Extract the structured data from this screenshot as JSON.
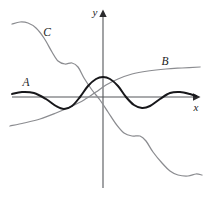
{
  "figure": {
    "background_color": "#ffffff",
    "axis_color": "#55565a",
    "curve_a_color": "#17171a",
    "curve_b_color": "#8b8c90",
    "curve_c_color": "#8b8c90"
  },
  "axes": {
    "x_label": "x",
    "y_label": "y",
    "origin_px": {
      "x": 103,
      "y": 97
    },
    "x_axis_from_px": {
      "x": 12,
      "y": 97
    },
    "x_axis_to_px": {
      "x": 198,
      "y": 97
    },
    "y_axis_from_px": {
      "x": 103,
      "y": 188
    },
    "y_axis_to_px": {
      "x": 103,
      "y": 12
    },
    "x_arrow": "right-arrow-icon",
    "y_arrow": "up-arrow-icon",
    "ticks": "none",
    "grid": "off"
  },
  "curves": [
    {
      "id": "A",
      "label": "A",
      "label_px": {
        "x": 26,
        "y": 86
      },
      "color": "#17171a",
      "style": "thick-black",
      "description": "Damped oscillating wave, even symmetry, global maximum at the origin",
      "points_px": [
        {
          "x": 12,
          "y": 94
        },
        {
          "x": 22,
          "y": 92
        },
        {
          "x": 34,
          "y": 93
        },
        {
          "x": 46,
          "y": 99
        },
        {
          "x": 56,
          "y": 106
        },
        {
          "x": 64,
          "y": 109
        },
        {
          "x": 72,
          "y": 106
        },
        {
          "x": 80,
          "y": 97
        },
        {
          "x": 88,
          "y": 86
        },
        {
          "x": 96,
          "y": 79
        },
        {
          "x": 103,
          "y": 77
        },
        {
          "x": 110,
          "y": 79
        },
        {
          "x": 118,
          "y": 86
        },
        {
          "x": 126,
          "y": 97
        },
        {
          "x": 134,
          "y": 105
        },
        {
          "x": 142,
          "y": 108
        },
        {
          "x": 150,
          "y": 106
        },
        {
          "x": 160,
          "y": 99
        },
        {
          "x": 170,
          "y": 93
        },
        {
          "x": 180,
          "y": 92
        },
        {
          "x": 190,
          "y": 94
        },
        {
          "x": 196,
          "y": 96
        }
      ]
    },
    {
      "id": "B",
      "label": "B",
      "label_px": {
        "x": 165,
        "y": 65
      },
      "color": "#8b8c90",
      "style": "thin-gray",
      "description": "Monotonically increasing sigmoid rising from lower left to a flat plateau on the right",
      "points_px": [
        {
          "x": 10,
          "y": 126
        },
        {
          "x": 24,
          "y": 123
        },
        {
          "x": 40,
          "y": 119
        },
        {
          "x": 56,
          "y": 113
        },
        {
          "x": 70,
          "y": 107
        },
        {
          "x": 84,
          "y": 100
        },
        {
          "x": 96,
          "y": 92
        },
        {
          "x": 106,
          "y": 85
        },
        {
          "x": 118,
          "y": 79
        },
        {
          "x": 132,
          "y": 74
        },
        {
          "x": 148,
          "y": 71
        },
        {
          "x": 166,
          "y": 69
        },
        {
          "x": 182,
          "y": 68
        },
        {
          "x": 200,
          "y": 67
        }
      ]
    },
    {
      "id": "C",
      "label": "C",
      "label_px": {
        "x": 47,
        "y": 36
      },
      "color": "#8b8c90",
      "style": "thin-gray",
      "description": "Monotonically decreasing staircase-like wave descending from upper left to lower right with flat shelves",
      "points_px": [
        {
          "x": 12,
          "y": 24
        },
        {
          "x": 20,
          "y": 22
        },
        {
          "x": 28,
          "y": 23
        },
        {
          "x": 36,
          "y": 28
        },
        {
          "x": 44,
          "y": 38
        },
        {
          "x": 52,
          "y": 52
        },
        {
          "x": 58,
          "y": 61
        },
        {
          "x": 65,
          "y": 64
        },
        {
          "x": 72,
          "y": 63
        },
        {
          "x": 78,
          "y": 67
        },
        {
          "x": 84,
          "y": 78
        },
        {
          "x": 92,
          "y": 90
        },
        {
          "x": 100,
          "y": 100
        },
        {
          "x": 108,
          "y": 112
        },
        {
          "x": 116,
          "y": 124
        },
        {
          "x": 124,
          "y": 133
        },
        {
          "x": 132,
          "y": 136
        },
        {
          "x": 140,
          "y": 136
        },
        {
          "x": 146,
          "y": 141
        },
        {
          "x": 153,
          "y": 152
        },
        {
          "x": 162,
          "y": 163
        },
        {
          "x": 170,
          "y": 171
        },
        {
          "x": 178,
          "y": 175
        },
        {
          "x": 188,
          "y": 176
        },
        {
          "x": 196,
          "y": 174
        },
        {
          "x": 202,
          "y": 175
        }
      ]
    }
  ]
}
